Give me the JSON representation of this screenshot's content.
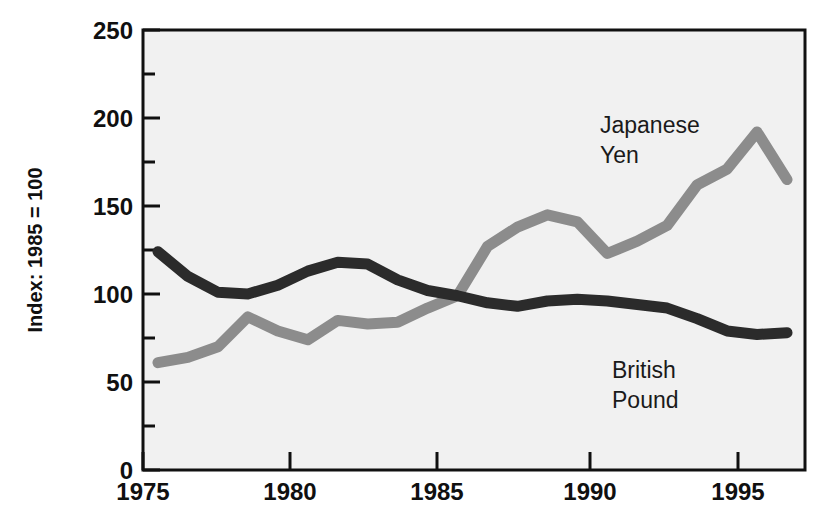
{
  "chart_data": {
    "type": "line",
    "title": "",
    "subtitle": "",
    "xlabel": "",
    "ylabel": "Index: 1985 = 100",
    "xlim": [
      1974.5,
      1996.6
    ],
    "ylim": [
      0,
      250
    ],
    "grid": false,
    "legend_position": "inline-annotations",
    "x_ticks": [
      "1975",
      "1980",
      "1985",
      "1990",
      "1995"
    ],
    "x_tick_values": [
      1975,
      1980,
      1985,
      1990,
      1995
    ],
    "x_minor_interval": 1,
    "y_ticks": [
      "0",
      "50",
      "100",
      "150",
      "200",
      "250"
    ],
    "y_tick_values": [
      0,
      50,
      100,
      150,
      200,
      250
    ],
    "y_minor_interval": 25,
    "x": [
      1975,
      1976,
      1977,
      1978,
      1979,
      1980,
      1981,
      1982,
      1983,
      1984,
      1985,
      1986,
      1987,
      1988,
      1989,
      1990,
      1991,
      1992,
      1993,
      1994,
      1995,
      1996
    ],
    "series": [
      {
        "name": "British Pound",
        "color": "#2b2b2b",
        "values": [
          124,
          110,
          101,
          100,
          105,
          113,
          118,
          117,
          108,
          102,
          99,
          95,
          93,
          96,
          97,
          96,
          94,
          92,
          86,
          79,
          77,
          78
        ]
      },
      {
        "name": "Japanese Yen",
        "color": "#8c8c8c",
        "values": [
          61,
          64,
          70,
          87,
          79,
          74,
          85,
          83,
          84,
          92,
          99,
          127,
          138,
          145,
          141,
          123,
          130,
          139,
          162,
          171,
          192,
          165
        ]
      }
    ],
    "annotations": [
      {
        "label_lines": [
          "Japanese",
          "Yen"
        ],
        "series": "Japanese Yen",
        "x": 1995,
        "y": 205
      },
      {
        "label_lines": [
          "British",
          "Pound"
        ],
        "series": "British Pound",
        "x": 1995,
        "y": 60
      }
    ]
  },
  "axes": {
    "y_title": "Index: 1985 = 100",
    "y_tick_labels": [
      "250",
      "200",
      "150",
      "100",
      "50",
      "0"
    ],
    "x_tick_labels": [
      "1975",
      "1980",
      "1985",
      "1990",
      "1995"
    ]
  },
  "annotation_text": {
    "yen_line1": "Japanese",
    "yen_line2": "Yen",
    "pound_line1": "British",
    "pound_line2": "Pound"
  },
  "colors": {
    "pound_line": "#2b2b2b",
    "yen_line": "#8c8c8c",
    "plot_background": "#f1f1f1",
    "axis": "#101010",
    "page_background": "#ffffff"
  }
}
